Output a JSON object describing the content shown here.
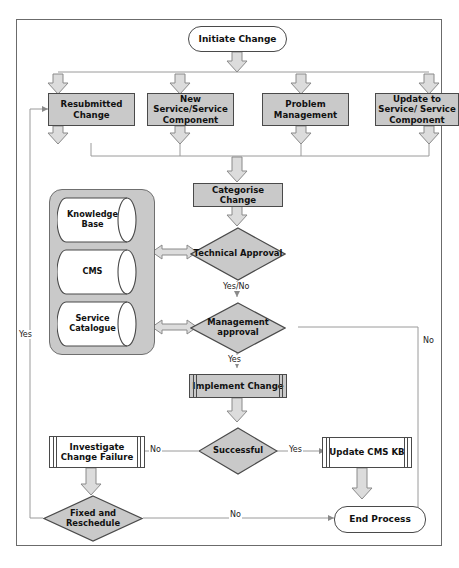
{
  "diagram": {
    "colors": {
      "process_fill": "#c9c9c9",
      "process_fill_dark": "#b0b0b0",
      "terminator_fill": "#ffffff",
      "decision_fill": "#c9c9c9",
      "group_fill": "#c9c9c9",
      "stroke": "#4a4a4a",
      "frame_stroke": "#6b6b6b",
      "arrow_fill": "#dcdcdc"
    }
  },
  "nodes": {
    "initiate": {
      "label": "Initiate Change",
      "shape": "terminator"
    },
    "resubmitted": {
      "label": "Resubmitted Change",
      "shape": "process"
    },
    "new_service": {
      "label": "New Service/Service Component",
      "shape": "process"
    },
    "problem_mgmt": {
      "label": "Problem Management",
      "shape": "process"
    },
    "update_service": {
      "label": "Update to Service/ Service Component",
      "shape": "process"
    },
    "categorise": {
      "label": "Categorise Change",
      "shape": "process"
    },
    "technical_approval": {
      "label": "Technical Approval",
      "shape": "decision"
    },
    "management_approval": {
      "label": "Management approval",
      "shape": "decision"
    },
    "implement": {
      "label": "Implement Change",
      "shape": "predefined-process"
    },
    "successful": {
      "label": "Successful",
      "shape": "decision"
    },
    "investigate": {
      "label": "Investigate Change Failure",
      "shape": "predefined-process"
    },
    "update_cms_kb": {
      "label": "Update CMS KB",
      "shape": "predefined-process"
    },
    "fixed_resched": {
      "label": "Fixed and Reschedule",
      "shape": "decision"
    },
    "end_process": {
      "label": "End Process",
      "shape": "terminator"
    }
  },
  "datastore_group": {
    "items": [
      {
        "label": "Knowledge Base",
        "shape": "cylinder"
      },
      {
        "label": "CMS",
        "shape": "cylinder"
      },
      {
        "label": "Service Catalogue",
        "shape": "cylinder"
      }
    ]
  },
  "edge_labels": {
    "technical_yesno": "Yes/No",
    "mgmt_yes": "Yes",
    "mgmt_no": "No",
    "successful_no": "No",
    "successful_yes": "Yes",
    "fixed_yes": "Yes",
    "fixed_no": "No"
  }
}
